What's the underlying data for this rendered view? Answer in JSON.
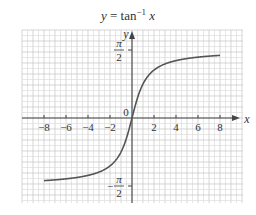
{
  "chart_data": {
    "type": "line",
    "title_parts": {
      "lhs": "y",
      "eq": " = tan",
      "sup": "−1",
      "var": " x"
    },
    "xlabel": "x",
    "ylabel": "y",
    "xlim": [
      -10,
      10
    ],
    "ylim": [
      -2,
      2
    ],
    "x_ticks": [
      -8,
      -6,
      -4,
      -2,
      2,
      4,
      6,
      8
    ],
    "x_tick_labels": [
      "−8",
      "−6",
      "−4",
      "−2",
      "2",
      "4",
      "6",
      "8"
    ],
    "origin_label": "0",
    "y_ticks": [
      {
        "value": 1.5708,
        "num": "π",
        "den": "2",
        "sign": ""
      },
      {
        "value": -1.5708,
        "num": "π",
        "den": "2",
        "sign": "−"
      }
    ],
    "grid": true,
    "series": [
      {
        "name": "y = arctan(x)",
        "function": "atan",
        "x_range": [
          -8,
          8
        ],
        "x": [
          -8,
          -6,
          -4,
          -3,
          -2,
          -1,
          -0.5,
          0,
          0.5,
          1,
          2,
          3,
          4,
          6,
          8
        ],
        "y": [
          -1.446,
          -1.406,
          -1.326,
          -1.249,
          -1.107,
          -0.785,
          -0.464,
          0,
          0.464,
          0.785,
          1.107,
          1.249,
          1.326,
          1.406,
          1.446
        ]
      }
    ],
    "asymptotes": [
      1.5708,
      -1.5708
    ]
  },
  "colors": {
    "grid_minor": "#dcdcdc",
    "grid_major": "#c4c4c4",
    "axis": "#444444",
    "curve": "#555555",
    "text": "#333333"
  }
}
